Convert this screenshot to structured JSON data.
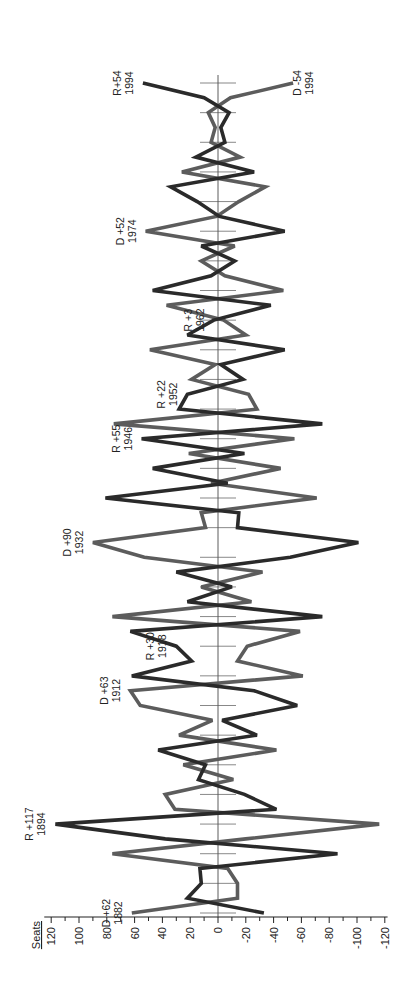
{
  "chart_data": {
    "type": "line",
    "orientation": "rotated-90-ccw",
    "title": "",
    "xlabel": "",
    "ylabel": "Seats",
    "ylim": [
      -120,
      120
    ],
    "yticks": [
      120,
      100,
      80,
      60,
      40,
      20,
      0,
      -20,
      -40,
      -60,
      -80,
      -100,
      -120
    ],
    "x": [
      1882,
      1884,
      1886,
      1888,
      1890,
      1892,
      1894,
      1896,
      1898,
      1900,
      1902,
      1904,
      1906,
      1908,
      1910,
      1912,
      1914,
      1916,
      1918,
      1920,
      1922,
      1924,
      1926,
      1928,
      1930,
      1932,
      1934,
      1936,
      1938,
      1940,
      1942,
      1944,
      1946,
      1948,
      1950,
      1952,
      1954,
      1956,
      1958,
      1960,
      1962,
      1964,
      1966,
      1968,
      1970,
      1972,
      1974,
      1976,
      1978,
      1980,
      1982,
      1984,
      1986,
      1988,
      1990,
      1992,
      1994
    ],
    "series": [
      {
        "name": "Republican",
        "color": "#2a2a2a",
        "values": [
          -33,
          22,
          12,
          13,
          -86,
          38,
          117,
          -42,
          -19,
          14,
          9,
          43,
          -28,
          -3,
          -57,
          -26,
          62,
          19,
          30,
          63,
          -75,
          22,
          -10,
          30,
          -52,
          -101,
          -14,
          -15,
          81,
          -7,
          47,
          -19,
          55,
          -75,
          28,
          22,
          -18,
          -2,
          -48,
          22,
          3,
          -38,
          47,
          5,
          -12,
          12,
          -48,
          -1,
          15,
          34,
          -26,
          16,
          -5,
          -2,
          -8,
          10,
          54
        ]
      },
      {
        "name": "Democrat",
        "color": "#5c5c5c",
        "values": [
          62,
          -14,
          -14,
          -7,
          76,
          -20,
          -116,
          31,
          38,
          -11,
          25,
          -42,
          28,
          4,
          56,
          63,
          -61,
          -14,
          -21,
          -59,
          76,
          -24,
          12,
          -32,
          53,
          90,
          9,
          12,
          -71,
          5,
          -45,
          21,
          -55,
          75,
          -28,
          -22,
          19,
          2,
          49,
          -20,
          -4,
          37,
          -47,
          -5,
          12,
          -12,
          52,
          1,
          -15,
          -34,
          26,
          -16,
          5,
          2,
          7,
          -9,
          -54
        ]
      }
    ],
    "annotations": [
      {
        "series": "Democrat",
        "year": 1882,
        "line1": "D +62",
        "line2": "1882"
      },
      {
        "series": "Republican",
        "year": 1894,
        "line1": "R +117",
        "line2": "1894"
      },
      {
        "series": "Democrat",
        "year": 1912,
        "line1": "D +63",
        "line2": "1912"
      },
      {
        "series": "Republican",
        "year": 1918,
        "line1": "R +30",
        "line2": "1918"
      },
      {
        "series": "Democrat",
        "year": 1932,
        "line1": "D +90",
        "line2": "1932"
      },
      {
        "series": "Republican",
        "year": 1946,
        "line1": "R +55",
        "line2": "1946"
      },
      {
        "series": "Republican",
        "year": 1952,
        "line1": "R +22",
        "line2": "1952"
      },
      {
        "series": "Republican",
        "year": 1962,
        "line1": "R +3",
        "line2": "1962"
      },
      {
        "series": "Democrat",
        "year": 1974,
        "line1": "D +52",
        "line2": "1974"
      },
      {
        "series": "Republican",
        "year": 1994,
        "line1": "R+54",
        "line2": "1994"
      },
      {
        "series": "Democrat",
        "year": 1994,
        "line1": "D -54",
        "line2": "1994",
        "side": "right"
      }
    ],
    "grid": false,
    "legend": "none"
  }
}
